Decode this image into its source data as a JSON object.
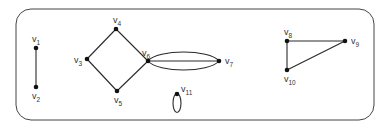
{
  "diagram": {
    "type": "graph",
    "frame": {
      "x": 16,
      "y": 9,
      "width": 358,
      "height": 111,
      "radius": 15
    },
    "vertices": [
      {
        "id": "v1",
        "base": "v",
        "sub": "1",
        "x": 36,
        "y": 48,
        "label_dx": -4,
        "label_dy": -6
      },
      {
        "id": "v2",
        "base": "v",
        "sub": "2",
        "x": 36,
        "y": 87,
        "label_dx": -4,
        "label_dy": 12
      },
      {
        "id": "v3",
        "base": "v",
        "sub": "3",
        "x": 87,
        "y": 59,
        "label_dx": -13,
        "label_dy": 4
      },
      {
        "id": "v4",
        "base": "v",
        "sub": "4",
        "x": 116,
        "y": 29,
        "label_dx": -3,
        "label_dy": -6
      },
      {
        "id": "v5",
        "base": "v",
        "sub": "5",
        "x": 117,
        "y": 91,
        "label_dx": -3,
        "label_dy": 12
      },
      {
        "id": "v6",
        "base": "v",
        "sub": "6",
        "x": 148,
        "y": 61,
        "label_dx": -6,
        "label_dy": -5
      },
      {
        "id": "v7",
        "base": "v",
        "sub": "7",
        "x": 219,
        "y": 61,
        "label_dx": 6,
        "label_dy": 3
      },
      {
        "id": "v8",
        "base": "v",
        "sub": "8",
        "x": 287,
        "y": 41,
        "label_dx": -3,
        "label_dy": -6
      },
      {
        "id": "v9",
        "base": "v",
        "sub": "9",
        "x": 345,
        "y": 41,
        "label_dx": 6,
        "label_dy": 3
      },
      {
        "id": "v10",
        "base": "v",
        "sub": "10",
        "x": 287,
        "y": 70,
        "label_dx": -3,
        "label_dy": 12
      },
      {
        "id": "v11",
        "base": "v",
        "sub": "11",
        "x": 177,
        "y": 94,
        "label_dx": 4,
        "label_dy": -2
      }
    ],
    "edges": [
      {
        "from": "v1",
        "to": "v2",
        "kind": "line"
      },
      {
        "from": "v3",
        "to": "v4",
        "kind": "line"
      },
      {
        "from": "v4",
        "to": "v6",
        "kind": "line"
      },
      {
        "from": "v3",
        "to": "v5",
        "kind": "line"
      },
      {
        "from": "v5",
        "to": "v6",
        "kind": "line"
      },
      {
        "from": "v6",
        "to": "v7",
        "kind": "line"
      },
      {
        "from": "v6",
        "to": "v7",
        "kind": "arc-up"
      },
      {
        "from": "v6",
        "to": "v7",
        "kind": "arc-down"
      },
      {
        "from": "v8",
        "to": "v9",
        "kind": "line"
      },
      {
        "from": "v8",
        "to": "v10",
        "kind": "line"
      },
      {
        "from": "v9",
        "to": "v10",
        "kind": "line"
      },
      {
        "from": "v11",
        "to": "v11",
        "kind": "loop"
      }
    ]
  }
}
